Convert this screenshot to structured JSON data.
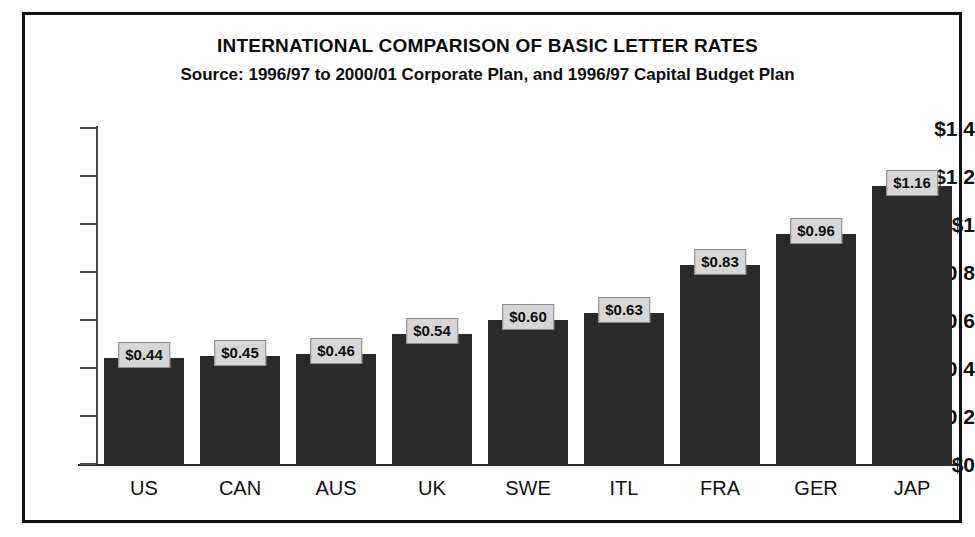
{
  "chart_data": {
    "type": "bar",
    "title": "INTERNATIONAL COMPARISON OF BASIC LETTER RATES",
    "subtitle": "Source: 1996/97 to 2000/01 Corporate Plan, and 1996/97 Capital Budget Plan",
    "xlabel": "",
    "ylabel": "",
    "categories": [
      "US",
      "CAN",
      "AUS",
      "UK",
      "SWE",
      "ITL",
      "FRA",
      "GER",
      "JAP"
    ],
    "values": [
      0.44,
      0.45,
      0.46,
      0.54,
      0.6,
      0.63,
      0.83,
      0.96,
      1.16
    ],
    "data_labels": [
      "$0.44",
      "$0.45",
      "$0.46",
      "$0.54",
      "$0.60",
      "$0.63",
      "$0.83",
      "$0.96",
      "$1.16"
    ],
    "ylim": [
      0,
      1.4
    ],
    "ytick_values": [
      0,
      0.2,
      0.4,
      0.6,
      0.8,
      1.0,
      1.2,
      1.4
    ],
    "ytick_labels": [
      "$0",
      "$0.2",
      "$0.4",
      "$0.6",
      "$0.8",
      "$1",
      "$1.2",
      "$1.4"
    ],
    "grid": false,
    "legend": false,
    "legend_position": "none",
    "bar_color": "#2a2a2a",
    "label_box_fill": "#d6d6d6",
    "label_box_border": "#8a8a8a",
    "axis_color": "#2b2b2b",
    "frame_color": "#111111",
    "background": "#ffffff"
  }
}
